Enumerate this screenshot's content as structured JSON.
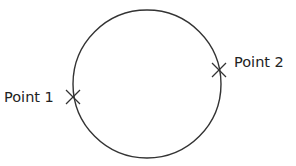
{
  "diagram": {
    "circle": {
      "cx": 147,
      "cy": 84,
      "r": 74,
      "stroke": "#333333"
    },
    "points": [
      {
        "label": "Point 1",
        "x": 73,
        "y": 97,
        "label_x": 4,
        "label_y": 102
      },
      {
        "label": "Point 2",
        "x": 219,
        "y": 70,
        "label_x": 234,
        "label_y": 67
      }
    ]
  }
}
